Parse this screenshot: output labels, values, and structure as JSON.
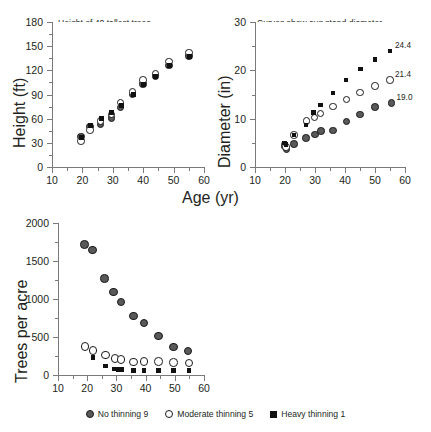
{
  "figure": {
    "shared_xlabel": "Age (yr)",
    "legend": [
      {
        "label": "No thinning 9",
        "marker": "circle-filled",
        "color": "#595959"
      },
      {
        "label": "Moderate thinning 5",
        "marker": "circle-open",
        "color": "#ffffff"
      },
      {
        "label": "Heavy thinning 1",
        "marker": "square-filled",
        "color": "#111111"
      }
    ]
  },
  "chart_data": [
    {
      "id": "height-panel",
      "type": "scatter",
      "title": "Height of 40 tallest trees",
      "xlabel": "Age (yr)",
      "ylabel": "Height (ft)",
      "xlim": [
        10,
        60
      ],
      "ylim": [
        0,
        180
      ],
      "xticks": [
        10,
        20,
        30,
        40,
        50,
        60
      ],
      "yticks": [
        0,
        30,
        60,
        90,
        120,
        150,
        180
      ],
      "grid": false,
      "legend_position": "figure-bottom",
      "series": [
        {
          "name": "No thinning 9",
          "marker": "circle-filled",
          "x": [
            19.5,
            22.5,
            26.0,
            29.5,
            32.5,
            36.5,
            40.0,
            44.0,
            48.5,
            55.0
          ],
          "y": [
            38,
            50,
            53,
            61,
            74,
            90,
            103,
            113,
            126,
            138
          ]
        },
        {
          "name": "Moderate thinning 5",
          "marker": "circle-open",
          "x": [
            19.5,
            22.5,
            26.0,
            29.5,
            32.5,
            36.5,
            40.0,
            44.0,
            48.5,
            55.0
          ],
          "y": [
            32,
            46,
            57,
            65,
            80,
            93,
            108,
            116,
            131,
            142
          ]
        },
        {
          "name": "Heavy thinning 1",
          "marker": "square-filled",
          "x": [
            19.7,
            22.7,
            26.2,
            29.7,
            32.7,
            36.7,
            40.2,
            44.2,
            48.7,
            55.2
          ],
          "y": [
            37,
            51,
            60,
            68,
            76,
            90,
            103,
            112,
            126,
            137
          ]
        }
      ]
    },
    {
      "id": "diameter-panel",
      "type": "scatter",
      "title": "",
      "note_lines": [
        "Curves show avg stand diameter.",
        "Avg diameter of largest 40 trees/ac",
        "shown to right of each curve."
      ],
      "xlabel": "Age (yr)",
      "ylabel": "Diameter (in)",
      "xlim": [
        10,
        60
      ],
      "ylim": [
        0,
        30
      ],
      "xticks": [
        10,
        20,
        30,
        40,
        50,
        60
      ],
      "yticks": [
        0,
        10,
        20,
        30
      ],
      "grid": false,
      "annotations": [
        {
          "text": "24.4",
          "series": "Heavy thinning 1",
          "x": 55.0,
          "y": 24.0
        },
        {
          "text": "21.4",
          "series": "Moderate thinning 5",
          "x": 55.0,
          "y": 18.0
        },
        {
          "text": "19.0",
          "series": "No thinning 9",
          "x": 55.5,
          "y": 13.2
        }
      ],
      "series": [
        {
          "name": "No thinning 9",
          "marker": "circle-filled",
          "x": [
            19.8,
            20.5,
            23.0,
            27.0,
            30.0,
            32.0,
            36.0,
            40.5,
            45.0,
            50.0,
            55.5
          ],
          "y": [
            4.2,
            3.7,
            4.8,
            6.0,
            6.7,
            7.5,
            7.6,
            9.4,
            10.9,
            12.4,
            13.2
          ]
        },
        {
          "name": "Moderate thinning 5",
          "marker": "circle-open",
          "x": [
            19.8,
            20.3,
            23.0,
            27.2,
            29.8,
            31.8,
            36.0,
            40.5,
            45.0,
            50.0,
            55.0
          ],
          "y": [
            4.6,
            4.1,
            6.6,
            9.5,
            10.2,
            11.1,
            12.5,
            14.0,
            15.4,
            16.8,
            18.0
          ]
        },
        {
          "name": "Heavy thinning 1",
          "marker": "square-filled",
          "x": [
            19.8,
            20.3,
            23.0,
            27.0,
            29.5,
            31.8,
            36.0,
            40.3,
            45.2,
            50.0,
            55.0
          ],
          "y": [
            5.0,
            4.6,
            6.6,
            8.7,
            11.3,
            12.8,
            15.3,
            18.0,
            20.3,
            22.2,
            24.0
          ]
        }
      ]
    },
    {
      "id": "trees-per-acre-panel",
      "type": "scatter",
      "title": "",
      "xlabel": "Age (yr)",
      "ylabel": "Trees per acre",
      "xlim": [
        10,
        60
      ],
      "ylim": [
        0,
        2000
      ],
      "xticks": [
        10,
        20,
        30,
        40,
        50,
        60
      ],
      "yticks": [
        0,
        500,
        1000,
        1500,
        2000
      ],
      "grid": false,
      "series": [
        {
          "name": "No thinning 9",
          "marker": "circle-filled",
          "x": [
            19.0,
            21.8,
            26.0,
            29.0,
            31.5,
            35.8,
            39.5,
            44.5,
            49.5,
            54.5
          ],
          "y": [
            1720,
            1645,
            1270,
            1090,
            960,
            775,
            685,
            515,
            370,
            315
          ]
        },
        {
          "name": "Moderate thinning 5",
          "marker": "circle-open",
          "x": [
            19.2,
            22.0,
            26.2,
            29.5,
            31.5,
            35.8,
            39.5,
            44.5,
            49.5,
            54.8
          ],
          "y": [
            375,
            320,
            260,
            215,
            205,
            170,
            175,
            175,
            165,
            160
          ]
        },
        {
          "name": "Heavy thinning 1",
          "marker": "square-filled",
          "x": [
            22.0,
            26.2,
            29.2,
            30.8,
            31.8,
            35.8,
            39.5,
            44.5,
            49.5,
            54.8
          ],
          "y": [
            230,
            120,
            80,
            75,
            70,
            60,
            60,
            58,
            58,
            58
          ]
        }
      ]
    }
  ]
}
